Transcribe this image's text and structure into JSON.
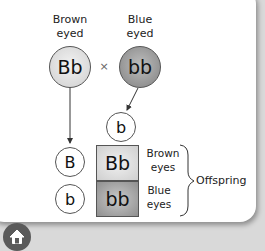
{
  "diagram": {
    "parent1": {
      "label_line1": "Brown",
      "label_line2": "eyed",
      "genotype": "Bb"
    },
    "parent2": {
      "label_line1": "Blue",
      "label_line2": "eyed",
      "genotype": "bb"
    },
    "cross_symbol": "×",
    "gametes_parent1": [
      "B",
      "b"
    ],
    "gamete_parent2": "b",
    "offspring": [
      {
        "genotype": "Bb",
        "phenotype_line1": "Brown",
        "phenotype_line2": "eyes"
      },
      {
        "genotype": "bb",
        "phenotype_line1": "Blue",
        "phenotype_line2": "eyes"
      }
    ],
    "offspring_label": "Offspring"
  },
  "nav": {
    "home_icon": "home-icon"
  }
}
